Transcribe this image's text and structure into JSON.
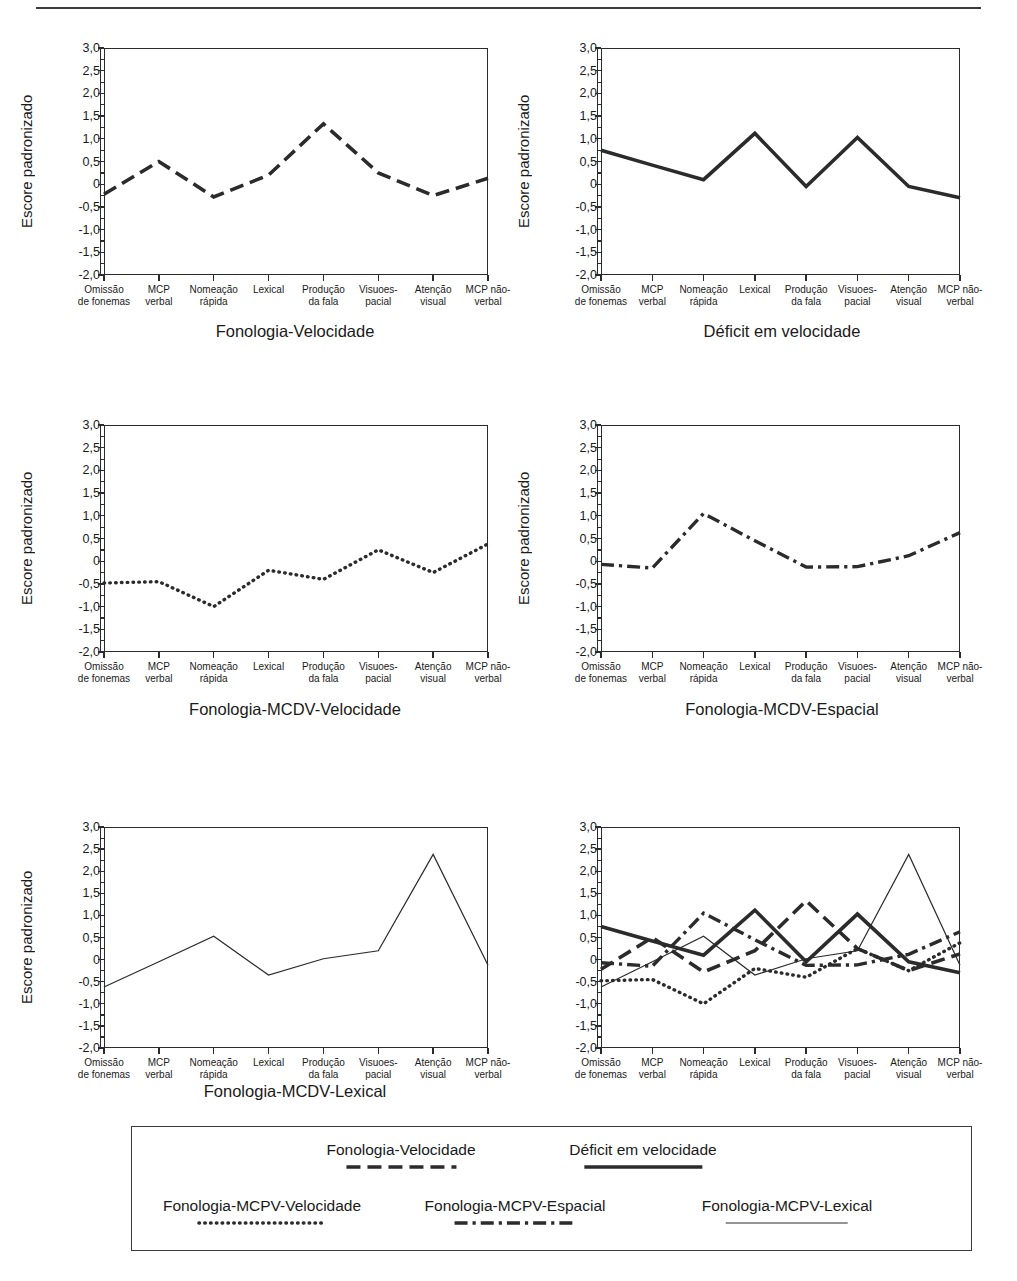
{
  "axis": {
    "ylabel": "Escore padronizado",
    "yticks": [
      "3,0",
      "2,5",
      "2,0",
      "1,5",
      "1,0",
      "0,5",
      "0",
      "-0,5",
      "-1,0",
      "-1,5",
      "-2,0"
    ],
    "ylim": [
      -2.0,
      3.0
    ],
    "categories": [
      [
        "Omissão",
        "de fonemas"
      ],
      [
        "MCP",
        "verbal"
      ],
      [
        "Nomeação",
        "rápida"
      ],
      [
        "Lexical",
        ""
      ],
      [
        "Produção",
        "da fala"
      ],
      [
        "Visuoes-",
        "pacial"
      ],
      [
        "Atenção",
        "visual"
      ],
      [
        "MCP não-",
        "verbal"
      ]
    ]
  },
  "chart_data": [
    {
      "type": "line",
      "title": "Fonologia-Velocidade",
      "xlabel": "",
      "ylabel": "Escore padronizado",
      "ylim": [
        -2.0,
        3.0
      ],
      "grid": false,
      "legend": "none",
      "categories": [
        "Omissão de fonemas",
        "MCP verbal",
        "Nomeação rápida",
        "Lexical",
        "Produção da fala",
        "Visuoes-pacial",
        "Atenção visual",
        "MCP não-verbal"
      ],
      "series": [
        {
          "name": "Fonologia-Velocidade",
          "style": "dashed",
          "values": [
            -0.22,
            0.5,
            -0.28,
            0.2,
            1.33,
            0.25,
            -0.25,
            0.13
          ]
        }
      ]
    },
    {
      "type": "line",
      "title": "Déficit em velocidade",
      "xlabel": "",
      "ylabel": "Escore padronizado",
      "ylim": [
        -2.0,
        3.0
      ],
      "grid": false,
      "legend": "none",
      "categories": [
        "Omissão de fonemas",
        "MCP verbal",
        "Nomeação rápida",
        "Lexical",
        "Produção da fala",
        "Visuoes-pacial",
        "Atenção visual",
        "MCP não-verbal"
      ],
      "series": [
        {
          "name": "Déficit em velocidade",
          "style": "solid-thick",
          "values": [
            0.75,
            0.42,
            0.1,
            1.12,
            -0.05,
            1.03,
            -0.05,
            -0.3
          ]
        }
      ]
    },
    {
      "type": "line",
      "title": "Fonologia-MCDV-Velocidade",
      "xlabel": "",
      "ylabel": "Escore padronizado",
      "ylim": [
        -2.0,
        3.0
      ],
      "grid": false,
      "legend": "none",
      "categories": [
        "Omissão de fonemas",
        "MCP verbal",
        "Nomeação rápida",
        "Lexical",
        "Produção da fala",
        "Visuoes-pacial",
        "Atenção visual",
        "MCP não-verbal"
      ],
      "series": [
        {
          "name": "Fonologia-MCPV-Velocidade",
          "style": "dotted",
          "values": [
            -0.48,
            -0.45,
            -1.0,
            -0.2,
            -0.4,
            0.25,
            -0.25,
            0.38
          ]
        }
      ]
    },
    {
      "type": "line",
      "title": "Fonologia-MCDV-Espacial",
      "xlabel": "",
      "ylabel": "Escore padronizado",
      "ylim": [
        -2.0,
        3.0
      ],
      "grid": false,
      "legend": "none",
      "categories": [
        "Omissão de fonemas",
        "MCP verbal",
        "Nomeação rápida",
        "Lexical",
        "Produção da fala",
        "Visuoes-pacial",
        "Atenção visual",
        "MCP não-verbal"
      ],
      "series": [
        {
          "name": "Fonologia-MCPV-Espacial",
          "style": "dashdot",
          "values": [
            -0.07,
            -0.15,
            1.05,
            0.45,
            -0.13,
            -0.12,
            0.12,
            0.63
          ]
        }
      ]
    },
    {
      "type": "line",
      "title": "Fonologia-MCDV-Lexical",
      "xlabel": "",
      "ylabel": "Escore padronizado",
      "ylim": [
        -2.0,
        3.0
      ],
      "grid": false,
      "legend": "none",
      "categories": [
        "Omissão de fonemas",
        "MCP verbal",
        "Nomeação rápida",
        "Lexical",
        "Produção da fala",
        "Visuoes-pacial",
        "Atenção visual",
        "MCP não-verbal"
      ],
      "series": [
        {
          "name": "Fonologia-MCPV-Lexical",
          "style": "solid-thin",
          "values": [
            -0.62,
            -0.05,
            0.53,
            -0.35,
            0.02,
            0.2,
            2.38,
            -0.13
          ]
        }
      ]
    },
    {
      "type": "line",
      "title": "",
      "xlabel": "",
      "ylabel": "",
      "ylim": [
        -2.0,
        3.0
      ],
      "grid": false,
      "legend": "bottom",
      "categories": [
        "Omissão de fonemas",
        "MCP verbal",
        "Nomeação rápida",
        "Lexical",
        "Produção da fala",
        "Visuoes-pacial",
        "Atenção visual",
        "MCP não-verbal"
      ],
      "series": [
        {
          "name": "Fonologia-Velocidade",
          "style": "dashed",
          "values": [
            -0.22,
            0.5,
            -0.28,
            0.2,
            1.33,
            0.25,
            -0.25,
            0.13
          ]
        },
        {
          "name": "Déficit em velocidade",
          "style": "solid-thick",
          "values": [
            0.75,
            0.42,
            0.1,
            1.12,
            -0.05,
            1.03,
            -0.05,
            -0.3
          ]
        },
        {
          "name": "Fonologia-MCPV-Velocidade",
          "style": "dotted",
          "values": [
            -0.48,
            -0.45,
            -1.0,
            -0.2,
            -0.4,
            0.25,
            -0.25,
            0.38
          ]
        },
        {
          "name": "Fonologia-MCPV-Espacial",
          "style": "dashdot",
          "values": [
            -0.07,
            -0.15,
            1.05,
            0.45,
            -0.13,
            -0.12,
            0.12,
            0.63
          ]
        },
        {
          "name": "Fonologia-MCPV-Lexical",
          "style": "solid-thin",
          "values": [
            -0.62,
            -0.05,
            0.53,
            -0.35,
            0.02,
            0.2,
            2.38,
            -0.13
          ]
        }
      ]
    }
  ],
  "legend": {
    "entries": [
      {
        "label": "Fonologia-Velocidade",
        "style": "dashed"
      },
      {
        "label": "Déficit em velocidade",
        "style": "solid-thick"
      },
      {
        "label": "Fonologia-MCPV-Velocidade",
        "style": "dotted"
      },
      {
        "label": "Fonologia-MCPV-Espacial",
        "style": "dashdot"
      },
      {
        "label": "Fonologia-MCPV-Lexical",
        "style": "solid-thin"
      }
    ]
  },
  "colors": {
    "ink": "#2b2b2b",
    "background": "#ffffff"
  }
}
